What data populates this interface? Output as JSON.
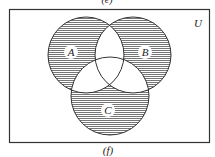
{
  "top_label_partial": "(e)",
  "caption": "(f)",
  "universe_label": "U",
  "sets": [
    {
      "label": "A",
      "cx": 86,
      "cy": 55,
      "r": 38
    },
    {
      "label": "B",
      "cx": 133,
      "cy": 55,
      "r": 38
    },
    {
      "label": "C",
      "cx": 110,
      "cy": 96,
      "r": 39
    }
  ],
  "shaded_regions": [
    "A only",
    "B only",
    "C only"
  ],
  "unshaded_regions": [
    "A∩B",
    "A∩C",
    "B∩C",
    "A∩B∩C",
    "outside"
  ],
  "colors": {
    "line": "#333333",
    "hatch": "#555555",
    "background": "#ffffff"
  }
}
